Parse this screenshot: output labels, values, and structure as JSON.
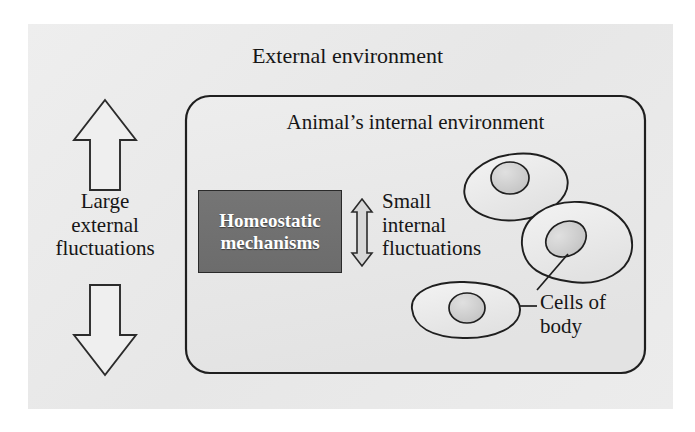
{
  "figure": {
    "domain": "diagram",
    "background_color": "#ffffff",
    "panel_color": "#ebebeb"
  },
  "labels": {
    "external_environment": "External environment",
    "internal_environment": "Animal’s internal environment",
    "large_external_fluctuations": "Large\nexternal\nfluctuations",
    "small_internal_fluctuations": "Small\ninternal\nfluctuations",
    "cells_of_body": "Cells of\nbody"
  },
  "homeostatic_box": {
    "text": "Homeostatic\nmechanisms",
    "fill_color": "#6f6f6f",
    "text_color": "#ffffff",
    "border_color": "#2a2a2a"
  },
  "arrows": {
    "external": {
      "name": "large-double-headed-arrow",
      "direction": "vertical-double",
      "size": "large",
      "fill_color": "#ececec",
      "stroke_color": "#2b2b2b"
    },
    "internal": {
      "name": "small-double-headed-arrow",
      "direction": "vertical-double",
      "size": "small",
      "fill_color": "#d8d8d8",
      "stroke_color": "#2b2b2b"
    }
  },
  "internal_environment_box": {
    "name": "rounded-container",
    "fill_color": "#e9e9e9",
    "stroke_color": "#1f1f1f",
    "corner_radius": 24
  },
  "cells": [
    {
      "name": "cell-1",
      "nucleus": true,
      "fill_color": "#ededed",
      "nucleus_color": "#cfcfcf"
    },
    {
      "name": "cell-2",
      "nucleus": true,
      "fill_color": "#ededed",
      "nucleus_color": "#cfcfcf"
    },
    {
      "name": "cell-3",
      "nucleus": true,
      "fill_color": "#ededed",
      "nucleus_color": "#cfcfcf"
    }
  ],
  "leader_lines": [
    {
      "name": "leader-to-cell-2",
      "from": "cells-of-body-label",
      "to": "cell-2"
    },
    {
      "name": "leader-to-cell-3",
      "from": "cells-of-body-label",
      "to": "cell-3"
    }
  ]
}
